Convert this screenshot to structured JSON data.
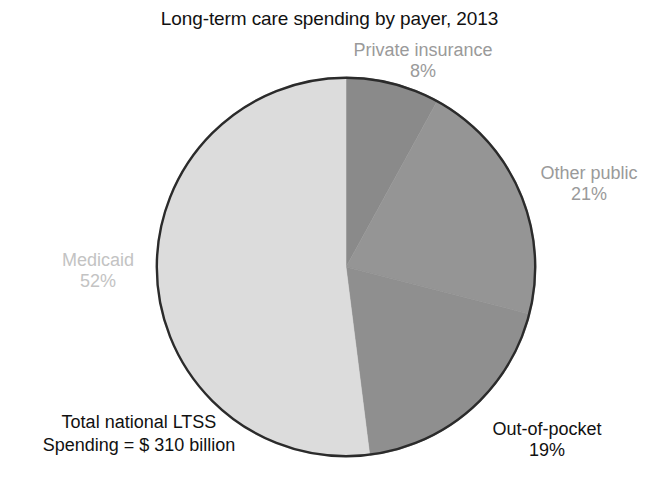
{
  "chart_data": {
    "type": "pie",
    "title": "Long-term care spending by payer, 2013",
    "xlabel": "",
    "ylabel": "",
    "legend_position": "none",
    "grid": false,
    "start_angle_deg": 0,
    "direction": "clockwise",
    "categories": [
      "Private insurance",
      "Other public",
      "Out-of-pocket",
      "Medicaid"
    ],
    "values": [
      8,
      21,
      19,
      52
    ],
    "value_unit": "percent",
    "slices": [
      {
        "label": "Private insurance",
        "percent_text": "8%",
        "value": 8,
        "color": "#8a8a8a",
        "label_color": "#9a9a9a"
      },
      {
        "label": "Other public",
        "percent_text": "21%",
        "value": 21,
        "color": "#959595",
        "label_color": "#9a9a9a"
      },
      {
        "label": "Out-of-pocket",
        "percent_text": "19%",
        "value": 19,
        "color": "#8f8f8f",
        "label_color": "#111111"
      },
      {
        "label": "Medicaid",
        "percent_text": "52%",
        "value": 52,
        "color": "#dcdcdc",
        "label_color": "#c3c3c3"
      }
    ],
    "annotations": [
      {
        "name": "total-spending-note",
        "line1": "Total national LTSS",
        "line2": "Spending = $ 310 billion"
      }
    ],
    "outline_color": "#2b2b2b",
    "background_color": "#ffffff"
  },
  "footnote": {
    "line1": "Total national LTSS",
    "line2": "Spending = $ 310 billion"
  }
}
